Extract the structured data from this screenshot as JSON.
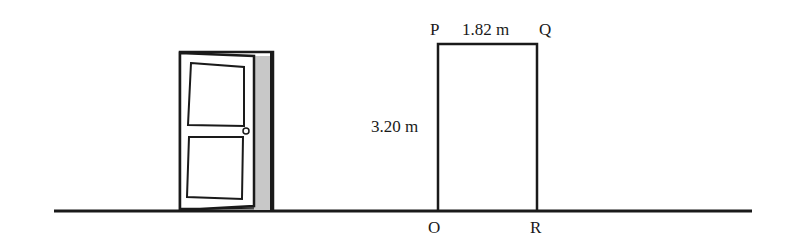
{
  "diagram": {
    "labels": {
      "top_left_vertex": "P",
      "top_right_vertex": "Q",
      "bottom_left_vertex": "O",
      "bottom_right_vertex": "R",
      "width": "1.82 m",
      "height": "3.20 m"
    },
    "objects": [
      "door",
      "rectangle",
      "ground-line"
    ],
    "colors": {
      "stroke": "#1a1a1a",
      "door_shadow": "#c8c8c8",
      "background": "#ffffff"
    }
  }
}
